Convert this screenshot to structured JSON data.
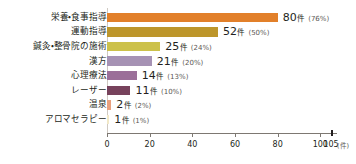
{
  "chart_data": {
    "type": "bar",
    "orientation": "horizontal",
    "title": "",
    "subtitle": "",
    "xlabel": "",
    "ylabel": "",
    "unit": "件",
    "xlim": [
      0,
      105
    ],
    "grid": false,
    "legend": null,
    "axis": {
      "ticks": [
        {
          "value": 0,
          "label": "0"
        },
        {
          "value": 20,
          "label": "20"
        },
        {
          "value": 40,
          "label": "40"
        },
        {
          "value": 60,
          "label": "60"
        },
        {
          "value": 80,
          "label": "80"
        },
        {
          "value": 100,
          "label": "100"
        },
        {
          "value": 105,
          "label": "105"
        }
      ],
      "unit_label": "(件)"
    },
    "categories": [
      "栄養・食事指導",
      "運動指導",
      "鍼灸・整骨院の施術",
      "漢方",
      "心理療法",
      "レーザー",
      "温泉",
      "アロマセラピー"
    ],
    "values": [
      80,
      52,
      25,
      21,
      14,
      11,
      2,
      1
    ],
    "percents": [
      "76%",
      "50%",
      "24%",
      "20%",
      "13%",
      "10%",
      "2%",
      "1%"
    ],
    "colors": [
      "#e2802a",
      "#bd962b",
      "#ccc14a",
      "#a692b4",
      "#9b6f99",
      "#77425c",
      "#e9a07e",
      "#f2e9c8"
    ],
    "bars": [
      {
        "category": "栄養・食事指導",
        "value": 80,
        "value_text": "80",
        "unit": "件",
        "percent_text": "(76%)",
        "color": "#e2802a"
      },
      {
        "category": "運動指導",
        "value": 52,
        "value_text": "52",
        "unit": "件",
        "percent_text": "(50%)",
        "color": "#bd962b"
      },
      {
        "category": "鍼灸・整骨院の施術",
        "value": 25,
        "value_text": "25",
        "unit": "件",
        "percent_text": "(24%)",
        "color": "#ccc14a"
      },
      {
        "category": "漢方",
        "value": 21,
        "value_text": "21",
        "unit": "件",
        "percent_text": "(20%)",
        "color": "#a692b4"
      },
      {
        "category": "心理療法",
        "value": 14,
        "value_text": "14",
        "unit": "件",
        "percent_text": "(13%)",
        "color": "#9b6f99"
      },
      {
        "category": "レーザー",
        "value": 11,
        "value_text": "11",
        "unit": "件",
        "percent_text": "(10%)",
        "color": "#77425c"
      },
      {
        "category": "温泉",
        "value": 2,
        "value_text": "2",
        "unit": "件",
        "percent_text": "(2%)",
        "color": "#e9a07e"
      },
      {
        "category": "アロマセラピー",
        "value": 1,
        "value_text": "1",
        "unit": "件",
        "percent_text": "(1%)",
        "color": "#f2e9c8"
      }
    ]
  }
}
